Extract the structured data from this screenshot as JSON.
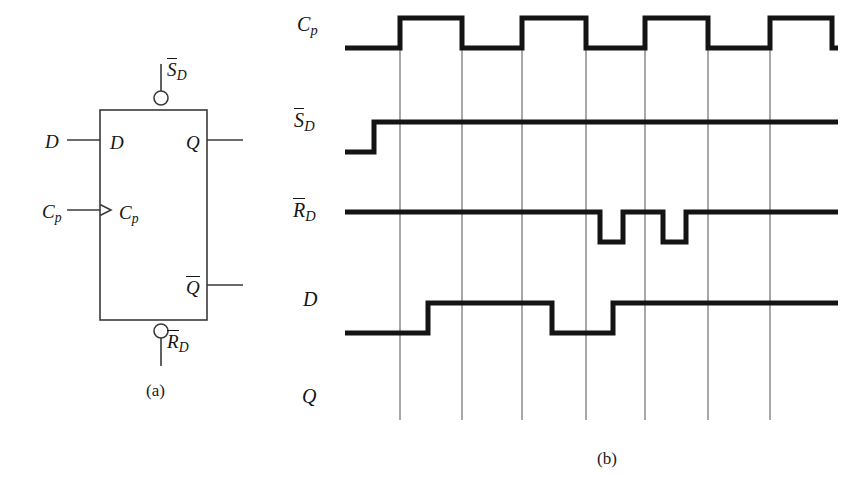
{
  "figure": {
    "panels": [
      {
        "id": "a",
        "caption": "(a)",
        "caption_x": 146,
        "caption_y": 381
      },
      {
        "id": "b",
        "caption": "(b)",
        "caption_x": 597,
        "caption_y": 449
      }
    ]
  },
  "symbol": {
    "title": "D flip-flop logic symbol",
    "box": {
      "x": 100,
      "y": 110,
      "width": 107,
      "height": 210
    },
    "internal_pins": [
      {
        "name": "D",
        "label": "D",
        "overbar": false,
        "x": 110,
        "y": 133
      },
      {
        "name": "Cp",
        "label": "C",
        "sub": "p",
        "overbar": false,
        "x": 119,
        "y": 203
      },
      {
        "name": "Q",
        "label": "Q",
        "overbar": false,
        "x": 186,
        "y": 133
      },
      {
        "name": "Qbar",
        "label": "Q",
        "overbar": true,
        "x": 186,
        "y": 276
      }
    ],
    "external_pins": [
      {
        "name": "D",
        "label": "D",
        "overbar": false,
        "x": 45,
        "y": 132
      },
      {
        "name": "Cp",
        "label": "C",
        "sub": "p",
        "overbar": false,
        "x": 42,
        "y": 202
      },
      {
        "name": "SDbar",
        "label": "S",
        "sub": "D",
        "overbar": true,
        "x": 167,
        "y": 58
      },
      {
        "name": "RDbar",
        "label": "R",
        "sub": "D",
        "overbar": true,
        "x": 167,
        "y": 330
      }
    ],
    "leads": {
      "d_in": {
        "x1": 67,
        "y": 140,
        "x2": 100
      },
      "cp_in": {
        "x1": 67,
        "y": 210,
        "x2": 100
      },
      "q_out": {
        "x1": 207,
        "y": 140,
        "x2": 243
      },
      "qbar_out": {
        "x1": 207,
        "y": 285,
        "x2": 243
      },
      "sd_in": {
        "x": 161,
        "y1": 64,
        "y2": 92
      },
      "rd_in": {
        "x": 161,
        "y1": 338,
        "y2": 366
      }
    },
    "bubbles": [
      {
        "name": "set-bubble",
        "cx": 161,
        "cy": 98,
        "r": 7
      },
      {
        "name": "reset-bubble",
        "cx": 161,
        "cy": 331,
        "r": 7
      }
    ],
    "clock_triangle": {
      "x": 100,
      "y": 210,
      "size": 11
    }
  },
  "timing": {
    "title": "Timing diagram",
    "gridlines": [
      400,
      462,
      522,
      586,
      645,
      708,
      770
    ],
    "grid_top": 48,
    "grid_bottom": 420,
    "trace_start": 345,
    "trace_end": 838,
    "rows": [
      {
        "name": "Cp",
        "label": "C",
        "sub": "p",
        "overbar": false,
        "label_x": 297,
        "label_y": 28,
        "high_y": 18,
        "low_y": 48,
        "blank": false,
        "start_level": 0,
        "transitions": [
          {
            "x": 400,
            "level": 1
          },
          {
            "x": 462,
            "level": 0
          },
          {
            "x": 522,
            "level": 1
          },
          {
            "x": 586,
            "level": 0
          },
          {
            "x": 645,
            "level": 1
          },
          {
            "x": 708,
            "level": 0
          },
          {
            "x": 770,
            "level": 1
          },
          {
            "x": 832,
            "level": 0
          }
        ]
      },
      {
        "name": "SDbar",
        "label": "S",
        "sub": "D",
        "overbar": true,
        "label_x": 294,
        "label_y": 122,
        "high_y": 122,
        "low_y": 152,
        "blank": false,
        "start_level": 0,
        "transitions": [
          {
            "x": 374,
            "level": 1
          }
        ]
      },
      {
        "name": "RDbar",
        "label": "R",
        "sub": "D",
        "overbar": true,
        "label_x": 293,
        "label_y": 212,
        "high_y": 212,
        "low_y": 242,
        "blank": false,
        "start_level": 1,
        "transitions": [
          {
            "x": 600,
            "level": 0
          },
          {
            "x": 623,
            "level": 1
          },
          {
            "x": 663,
            "level": 0
          },
          {
            "x": 686,
            "level": 1
          }
        ]
      },
      {
        "name": "D",
        "label": "D",
        "sub": "",
        "overbar": false,
        "label_x": 303,
        "label_y": 303,
        "high_y": 303,
        "low_y": 333,
        "blank": false,
        "start_level": 0,
        "transitions": [
          {
            "x": 428,
            "level": 1
          },
          {
            "x": 552,
            "level": 0
          },
          {
            "x": 613,
            "level": 1
          }
        ]
      },
      {
        "name": "Q",
        "label": "Q",
        "sub": "",
        "overbar": false,
        "label_x": 302,
        "label_y": 400,
        "high_y": 390,
        "low_y": 420,
        "blank": true,
        "start_level": 0,
        "transitions": []
      }
    ]
  },
  "style": {
    "trace_color": "#141414",
    "grid_color": "#6e6e6e",
    "symbol_line_color": "#3a3a3a",
    "background": "#ffffff",
    "trace_width": 5,
    "grid_width": 1.2,
    "symbol_width": 1.6
  }
}
